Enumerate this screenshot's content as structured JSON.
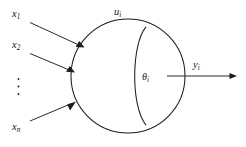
{
  "figure": {
    "title": "",
    "type": "neuron-threshold-diagram",
    "colors": {
      "stroke": "#1d1d1f",
      "text": "#161616",
      "background": "#ffffff"
    },
    "labels": {
      "input_1": "x",
      "input_1_sub": "1",
      "input_2": "x",
      "input_2_sub": "2",
      "input_n": "x",
      "input_n_sub": "n",
      "ellipsis": "⋮",
      "body": "u",
      "body_sub": "i",
      "threshold": "θ",
      "threshold_sub": "i",
      "output": "y",
      "output_sub": "i"
    },
    "geometry": {
      "circle": {
        "cx": 128,
        "cy": 76,
        "r": 57
      },
      "inner_arc": "M 145.5 27.5 C 131 45 130 105 145.5 124.5",
      "lens_arc": "M 145.5 27.5 A 57 57 0 0 1 145.5 124.5",
      "input_arrows": [
        {
          "name": "x1",
          "x1": 30,
          "y1": 22,
          "x2": 83,
          "y2": 47
        },
        {
          "name": "x2",
          "x1": 30,
          "y1": 53,
          "x2": 73.5,
          "y2": 72
        },
        {
          "name": "xn",
          "x1": 30,
          "y1": 121,
          "x2": 74.5,
          "y2": 102
        }
      ],
      "output_arrow": {
        "x1": 173,
        "y1": 76,
        "x2": 236,
        "y2": 76
      },
      "ellipsis_dots": [
        {
          "cx": 19,
          "cy": 79
        },
        {
          "cx": 19,
          "cy": 86
        },
        {
          "cx": 19,
          "cy": 93
        }
      ]
    }
  }
}
